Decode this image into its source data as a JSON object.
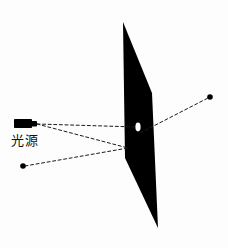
{
  "figure": {
    "background_color": "#fdfdfd",
    "ink_color": "#000000",
    "width": 228,
    "height": 248
  },
  "labels": {
    "light_source": "光源"
  },
  "icons": {
    "lamp": "flashlight-icon",
    "pinhole": "pinhole-icon",
    "barrier": "opaque-screen-icon",
    "ray_upper": "dashed-ray-icon",
    "ray_lower": "dashed-ray-icon",
    "ray_center": "dashed-ray-icon",
    "point_upper_right": "point-dot-icon",
    "point_lower_left": "point-dot-icon"
  },
  "chart_data": {
    "type": "scatter",
    "title": "",
    "xlabel": "",
    "ylabel": "",
    "grid": false,
    "legend": null,
    "xlim": [
      0,
      228
    ],
    "ylim": [
      0,
      248
    ],
    "elements": {
      "barrier_polygon": [
        [
          123,
          22
        ],
        [
          152,
          93
        ],
        [
          158,
          228
        ],
        [
          125,
          158
        ]
      ],
      "pinhole": {
        "cx": 138,
        "cy": 127,
        "rx": 2.6,
        "ry": 4.4,
        "fill": "#ffffff"
      },
      "lamp": {
        "body": {
          "x": 14,
          "y": 119,
          "w": 18,
          "h": 9
        },
        "nozzle": {
          "x": 32,
          "y": 121,
          "w": 5,
          "h": 5
        }
      },
      "points": [
        {
          "name": "upper-right-image-point",
          "x": 210,
          "y": 97,
          "r": 2.8
        },
        {
          "name": "lower-left-object-point",
          "x": 23,
          "y": 166,
          "r": 2.8
        }
      ],
      "rays": [
        {
          "name": "lamp-to-pinhole",
          "from": [
            37,
            124
          ],
          "to": [
            137,
            127
          ]
        },
        {
          "name": "lamp-to-lower-vertex",
          "from": [
            37,
            124
          ],
          "to": [
            128,
            148
          ]
        },
        {
          "name": "pinhole-to-upper-right",
          "from": [
            140,
            133
          ],
          "to": [
            208,
            98
          ]
        },
        {
          "name": "lower-left-to-vertex",
          "from": [
            25,
            166
          ],
          "to": [
            128,
            148
          ]
        }
      ]
    },
    "annotations": [
      {
        "text": "光源",
        "x": 11,
        "y": 141
      }
    ]
  }
}
